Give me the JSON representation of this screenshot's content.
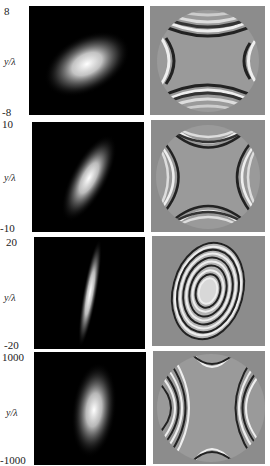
{
  "figure": {
    "rows": [
      {
        "y_top": "8",
        "y_bottom": "-8",
        "y_label": "y/λ",
        "amplitude_panel": {
          "beam_shape": "elliptical Gaussian, tilted ~30° from horizontal"
        },
        "phase_panel": {
          "pattern": "saddle (astigmatic) phase wraps in circular aperture"
        }
      },
      {
        "y_top": "10",
        "y_bottom": "-10",
        "y_label": "y/λ",
        "amplitude_panel": {
          "beam_shape": "elongated Gaussian, tilted ~60° from horizontal"
        },
        "phase_panel": {
          "pattern": "saddle phase wraps, four-fold hyperbolic fringes"
        }
      },
      {
        "y_top": "20",
        "y_bottom": "-20",
        "y_label": "y/λ",
        "amplitude_panel": {
          "beam_shape": "narrow line focus, near vertical"
        },
        "phase_panel": {
          "pattern": "concentric elliptical phase rings"
        }
      },
      {
        "y_top": "1000",
        "y_bottom": "-1000",
        "y_label": "y/λ",
        "amplitude_panel": {
          "beam_shape": "vertical elliptical Gaussian"
        },
        "phase_panel": {
          "pattern": "dense saddle phase wraps in circular aperture"
        }
      }
    ]
  }
}
